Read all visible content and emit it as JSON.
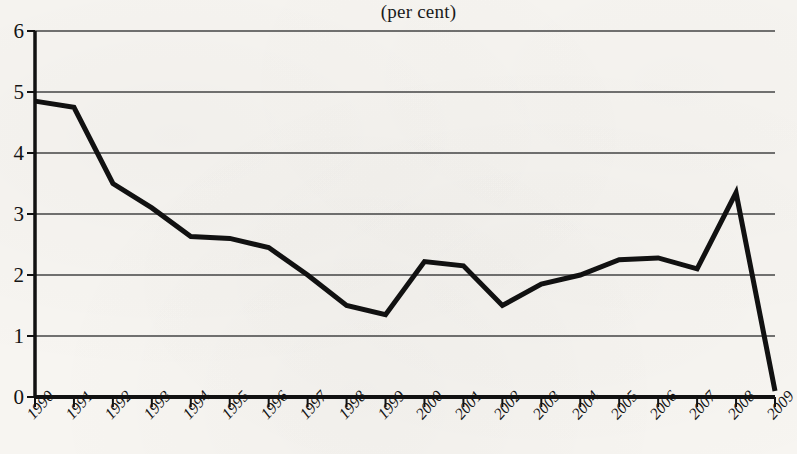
{
  "chart": {
    "title": "(per cent)",
    "xlabel": "",
    "ylabel": ""
  },
  "chart_data": {
    "type": "line",
    "title": "(per cent)",
    "xlabel": "",
    "ylabel": "",
    "ylim": [
      0,
      6
    ],
    "ytick_values": [
      0,
      1,
      2,
      3,
      4,
      5,
      6
    ],
    "ytick_labels": [
      "0",
      "1",
      "2",
      "3",
      "4",
      "5",
      "6"
    ],
    "grid": true,
    "legend": false,
    "categories": [
      "1990",
      "1991",
      "1992",
      "1993",
      "1994",
      "1995",
      "1996",
      "1997",
      "1998",
      "1999",
      "2000",
      "2001",
      "2002",
      "2003",
      "2004",
      "2005",
      "2006",
      "2007",
      "2008",
      "2009"
    ],
    "values": [
      4.85,
      4.75,
      3.5,
      3.1,
      2.63,
      2.6,
      2.45,
      2.0,
      1.5,
      1.35,
      2.22,
      2.15,
      1.5,
      1.85,
      2.0,
      2.25,
      2.28,
      2.1,
      3.35,
      0.1
    ],
    "line_color": "#111111",
    "line_width": 5
  },
  "axis": {
    "y_labels": [
      "6",
      "5",
      "4",
      "3",
      "2",
      "1",
      "0"
    ],
    "x_labels": [
      "1990",
      "1991",
      "1992",
      "1993",
      "1994",
      "1995",
      "1996",
      "1997",
      "1998",
      "1999",
      "2000",
      "2001",
      "2002",
      "2003",
      "2004",
      "2005",
      "2006",
      "2007",
      "2008",
      "2009"
    ]
  }
}
